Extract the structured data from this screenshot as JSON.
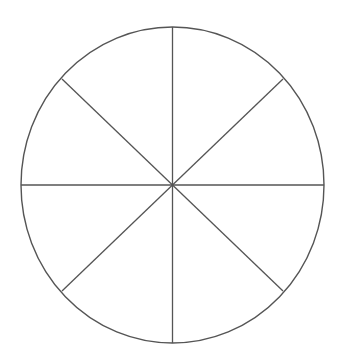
{
  "diagram": {
    "type": "circle-divided",
    "sections": 8,
    "center": {
      "x": 172.5,
      "y": 185
    },
    "rx": 151.5,
    "ry": 158,
    "stroke_color": "#555555",
    "background": "#ffffff",
    "spokes": [
      {
        "x1": 172.5,
        "y1": 27,
        "x2": 172.5,
        "y2": 343
      },
      {
        "x1": 21,
        "y1": 185,
        "x2": 324,
        "y2": 185
      },
      {
        "x1": 62,
        "y1": 79,
        "x2": 283,
        "y2": 291
      },
      {
        "x1": 283,
        "y1": 79,
        "x2": 62,
        "y2": 291
      }
    ]
  }
}
